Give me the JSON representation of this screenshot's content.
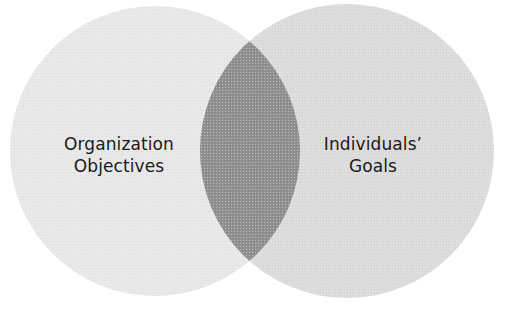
{
  "figure": {
    "type": "venn-diagram",
    "background_color": "#ffffff",
    "width": 506,
    "height": 317
  },
  "sets": {
    "left": {
      "label_line1": "Organization",
      "label_line2": "Objectives",
      "fill_color": "#e8e8e8",
      "center_x": 155,
      "center_y": 151,
      "radius": 145
    },
    "right": {
      "label_line1": "Individuals’",
      "label_line2": "Goals",
      "fill_color": "#dcdcdc",
      "center_x": 347,
      "center_y": 151,
      "radius": 147
    },
    "intersection": {
      "fill_color": "#909090"
    }
  },
  "text": {
    "color": "#1a1a1a"
  }
}
